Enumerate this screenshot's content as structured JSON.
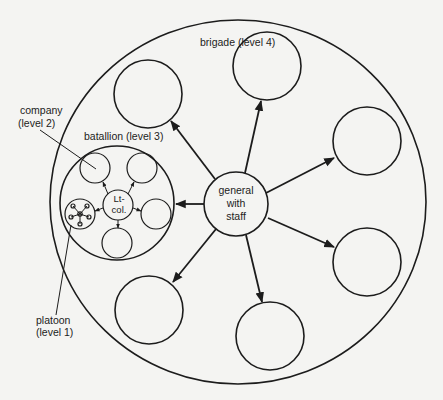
{
  "diagram": {
    "labels": {
      "brigade": "brigade (level 4)",
      "battalion": "batallion (level 3)",
      "company_line1": "company",
      "company_line2": "(level 2)",
      "platoon_line1": "platoon",
      "platoon_line2": "(level 1)",
      "general_line1": "general",
      "general_line2": "with",
      "general_line3": "staff",
      "ltcol_line1": "Lt-",
      "ltcol_line2": "col."
    },
    "levels": [
      {
        "level": 1,
        "name": "platoon"
      },
      {
        "level": 2,
        "name": "company"
      },
      {
        "level": 3,
        "name": "batallion"
      },
      {
        "level": 4,
        "name": "brigade"
      }
    ],
    "brigade_units": 7,
    "battalion_units": 6,
    "platoon_members": 5,
    "colors": {
      "ink": "#1c1c1c",
      "paper": "#f4f4f2"
    }
  }
}
